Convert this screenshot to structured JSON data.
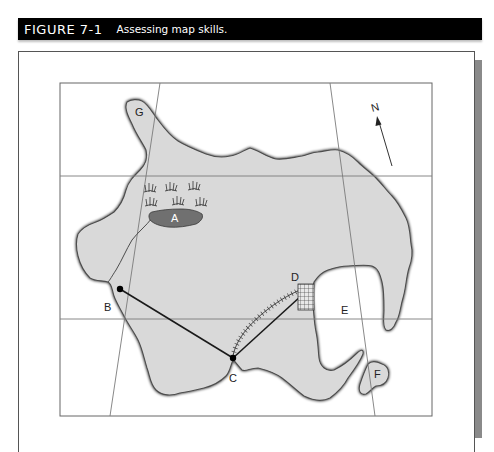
{
  "figure": {
    "number": "FIGURE 7-1",
    "caption": "Assessing map skills."
  },
  "map": {
    "north_label": "N",
    "point_labels": {
      "a": "A",
      "b": "B",
      "c": "C",
      "d": "D",
      "e": "E",
      "f": "F",
      "g": "G"
    },
    "features": [
      {
        "id": "A",
        "type": "lake with marsh"
      },
      {
        "id": "B",
        "type": "point on coast (road endpoint)"
      },
      {
        "id": "C",
        "type": "point on coast (road/railroad junction)"
      },
      {
        "id": "D",
        "type": "town grid"
      },
      {
        "id": "E",
        "type": "bay"
      },
      {
        "id": "F",
        "type": "island"
      },
      {
        "id": "G",
        "type": "peninsula"
      }
    ],
    "colors": {
      "land": "#d9d9d9",
      "lake": "#707070",
      "coast": "#555555",
      "grid": "#888888",
      "header_bg": "#000000"
    }
  }
}
